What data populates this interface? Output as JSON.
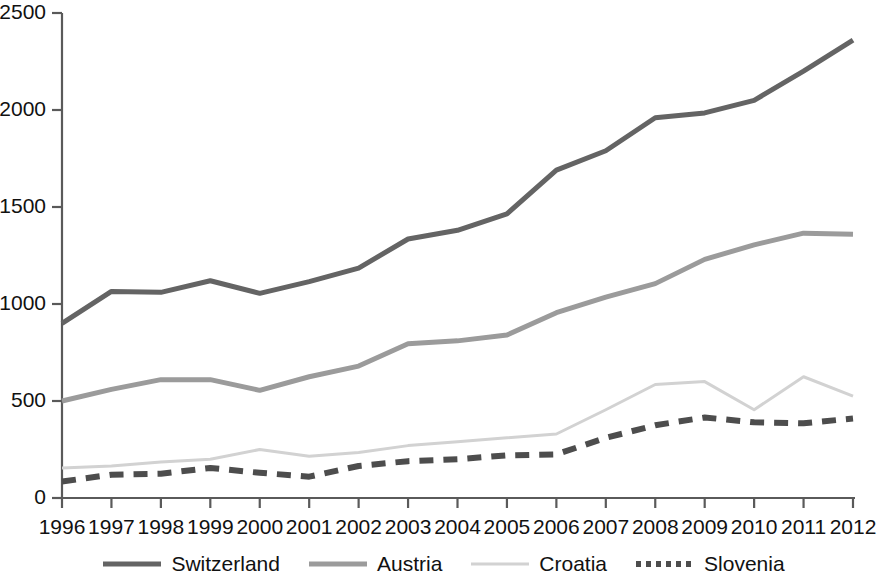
{
  "chart_data": {
    "type": "line",
    "title": "",
    "subtitle": "",
    "xlabel": "",
    "ylabel": "",
    "grid": false,
    "legend_position": "bottom",
    "categories": [
      "1996",
      "1997",
      "1998",
      "1999",
      "2000",
      "2001",
      "2002",
      "2003",
      "2004",
      "2005",
      "2006",
      "2007",
      "2008",
      "2009",
      "2010",
      "2011",
      "2012"
    ],
    "x": [
      1996,
      1997,
      1998,
      1999,
      2000,
      2001,
      2002,
      2003,
      2004,
      2005,
      2006,
      2007,
      2008,
      2009,
      2010,
      2011,
      2012
    ],
    "xlim": [
      1996,
      2012
    ],
    "ylim": [
      0,
      2500
    ],
    "yticks": [
      0,
      500,
      1000,
      1500,
      2000,
      2500
    ],
    "ytick_labels": [
      "0",
      "500",
      "1000",
      "1500",
      "2000",
      "2500"
    ],
    "xtick_labels": [
      "1996",
      "1997",
      "1998",
      "1999",
      "2000",
      "2001",
      "2002",
      "2003",
      "2004",
      "2005",
      "2006",
      "2007",
      "2008",
      "2009",
      "2010",
      "2011",
      "2012"
    ],
    "series": [
      {
        "name": "Switzerland",
        "color": "#646464",
        "style": "solid",
        "width": 5,
        "values": [
          900,
          1065,
          1060,
          1120,
          1055,
          1115,
          1185,
          1335,
          1380,
          1465,
          1690,
          1790,
          1960,
          1985,
          2050,
          2200,
          2360
        ]
      },
      {
        "name": "Austria",
        "color": "#9b9b9b",
        "style": "solid",
        "width": 5,
        "values": [
          500,
          560,
          610,
          610,
          555,
          625,
          680,
          795,
          810,
          840,
          955,
          1035,
          1105,
          1230,
          1305,
          1365,
          1360
        ]
      },
      {
        "name": "Croatia",
        "color": "#d2d2d2",
        "style": "solid",
        "width": 3,
        "values": [
          155,
          165,
          185,
          200,
          250,
          215,
          235,
          270,
          290,
          310,
          330,
          455,
          585,
          600,
          455,
          625,
          525
        ]
      },
      {
        "name": "Slovenia",
        "color": "#4d4d4d",
        "style": "dashed",
        "width": 6,
        "values": [
          85,
          120,
          125,
          155,
          130,
          110,
          165,
          190,
          200,
          220,
          225,
          310,
          375,
          415,
          390,
          385,
          410
        ]
      }
    ]
  },
  "legend": {
    "items": [
      {
        "label": "Switzerland",
        "swatch": "legend-line-switzerland"
      },
      {
        "label": "Austria",
        "swatch": "legend-line-austria"
      },
      {
        "label": "Croatia",
        "swatch": "legend-line-croatia"
      },
      {
        "label": "Slovenia",
        "swatch": "legend-line-slovenia"
      }
    ]
  },
  "axes": {
    "axis_color": "#5a5a5a"
  }
}
